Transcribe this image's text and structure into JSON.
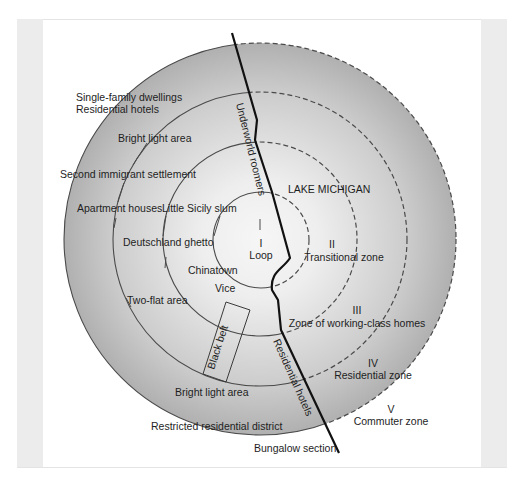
{
  "diagram": {
    "colors": {
      "disc_center": "#f4f4f4",
      "disc_edge": "#b2b2b2",
      "ring_stroke": "#4a4a4a",
      "river": "#111111",
      "text": "#1e1e1e",
      "side_strip": "#ececec"
    },
    "zones": [
      {
        "numeral": "I",
        "name": "Loop"
      },
      {
        "numeral": "II",
        "name": "Transitional zone"
      },
      {
        "numeral": "III",
        "name": "Zone of working-class homes"
      },
      {
        "numeral": "IV",
        "name": "Residential zone"
      },
      {
        "numeral": "V",
        "name": "Commuter zone"
      }
    ],
    "lake_label": "LAKE MICHIGAN",
    "district_labels": {
      "single_family": "Single-family dwellings",
      "residential_hotels_top": "Residential hotels",
      "bright_light_top": "Bright light area",
      "second_immigrant": "Second immigrant settlement",
      "apartment_houses": "Apartment houses",
      "little_sicily": "Little Sicily slum",
      "deutschland": "Deutschland ghetto",
      "chinatown": "Chinatown",
      "vice": "Vice",
      "two_flat": "Two-flat area",
      "black_belt": "Black belt",
      "bright_light_bottom": "Bright light area",
      "restricted": "Restricted residential district",
      "bungalow": "Bungalow section",
      "underworld": "Underworld roomers",
      "residential_hotels_river": "Residential hotels"
    }
  }
}
